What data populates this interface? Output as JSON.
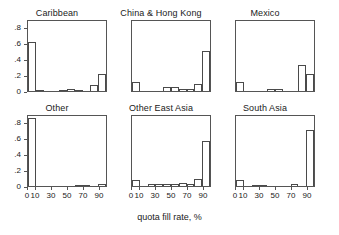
{
  "chart_data": {
    "type": "bar",
    "title": "",
    "xlabel": "quota fill rate, %",
    "ylabel": "",
    "grid": false,
    "legend": "none",
    "layout": "3 columns x 2 rows of small-multiple histograms",
    "ylim": [
      0,
      0.9
    ],
    "xlim": [
      0,
      100
    ],
    "ytick_labels": [
      "0",
      ".2",
      ".4",
      ".6",
      ".8"
    ],
    "ytick_values": [
      0,
      0.2,
      0.4,
      0.6,
      0.8
    ],
    "xtick_labels": [
      "0",
      "10",
      "30",
      "50",
      "70",
      "90"
    ],
    "xtick_values": [
      0,
      10,
      30,
      50,
      70,
      90
    ],
    "bin_width": 10,
    "bin_starts": [
      0,
      10,
      20,
      30,
      40,
      50,
      60,
      70,
      80,
      90
    ],
    "panels": [
      {
        "title": "Caribbean",
        "values": [
          0.63,
          0.01,
          0.0,
          0.0,
          0.01,
          0.025,
          0.01,
          0.0,
          0.08,
          0.22
        ]
      },
      {
        "title": "China & Hong Kong",
        "values": [
          0.12,
          0.0,
          0.0,
          0.0,
          0.05,
          0.05,
          0.03,
          0.03,
          0.09,
          0.52
        ]
      },
      {
        "title": "Mexico",
        "values": [
          0.12,
          0.0,
          0.0,
          0.0,
          0.02,
          0.02,
          0.0,
          0.0,
          0.33,
          0.22
        ]
      },
      {
        "title": "Other",
        "values": [
          0.87,
          0.0,
          0.0,
          0.0,
          0.0,
          0.0,
          0.01,
          0.01,
          0.0,
          0.025
        ]
      },
      {
        "title": "Other East Asia",
        "values": [
          0.08,
          0.0,
          0.02,
          0.02,
          0.03,
          0.03,
          0.04,
          0.02,
          0.09,
          0.58
        ]
      },
      {
        "title": "South Asia",
        "values": [
          0.08,
          0.0,
          0.01,
          0.01,
          0.0,
          0.0,
          0.0,
          0.02,
          0.0,
          0.72
        ]
      }
    ]
  },
  "figure": {
    "caption": "quota fill rate, %"
  }
}
